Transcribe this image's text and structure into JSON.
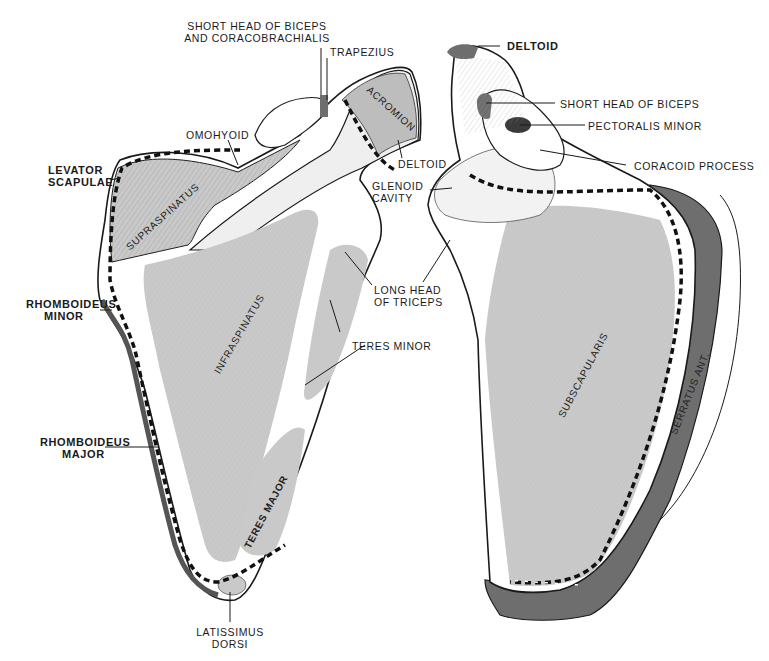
{
  "figure": {
    "colors": {
      "bone": "#ffffff",
      "muscle_light": "#c9c9c9",
      "muscle_dark": "#6e6e6e",
      "outline": "#1a1a1a"
    }
  },
  "posterior_view": {
    "labels": {
      "short_head_biceps": [
        "SHORT HEAD OF BICEPS",
        "AND CORACOBRACHIALIS"
      ],
      "trapezius": "TRAPEZIUS",
      "acromion": "ACROMION",
      "omohyoid": "OMOHYOID",
      "levator_scapulae": [
        "LEVATOR",
        "SCAPULAE"
      ],
      "supraspinatus": "SUPRASPINATUS",
      "deltoid": "DELTOID",
      "glenoid_cavity": [
        "GLENOID",
        "CAVITY"
      ],
      "rhomboideus_minor": [
        "RHOMBOIDEUS",
        "MINOR"
      ],
      "infraspinatus": "INFRASPINATUS",
      "long_head_triceps": [
        "LONG HEAD",
        "OF TRICEPS"
      ],
      "teres_minor": "TERES MINOR",
      "rhomboideus_major": [
        "RHOMBOIDEUS",
        "MAJOR"
      ],
      "teres_major": "TERES MAJOR",
      "latissimus_dorsi": [
        "LATISSIMUS",
        "DORSI"
      ]
    }
  },
  "anterior_view": {
    "labels": {
      "deltoid": "DELTOID",
      "short_head_biceps": "SHORT HEAD OF BICEPS",
      "pectoralis_minor": "PECTORALIS MINOR",
      "coracoid_process": "CORACOID PROCESS",
      "subscapularis": "SUBSCAPULARIS",
      "serratus_ant": "SERRATUS ANT."
    }
  }
}
